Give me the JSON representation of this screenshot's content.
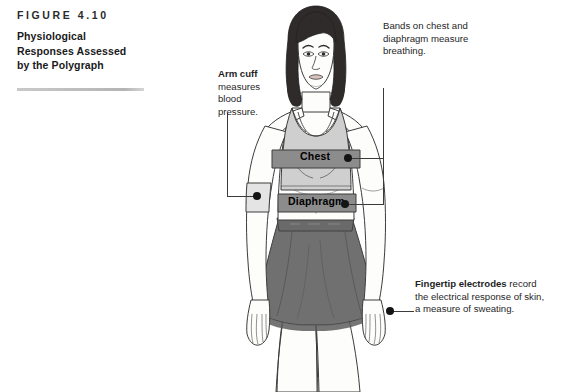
{
  "caption": {
    "figure_number": "Figure 4.10",
    "title_line1": "Physiological",
    "title_line2": "Responses Assessed",
    "title_line3": "by the Polygraph",
    "rule_color": "#b4b4b4"
  },
  "annotations": {
    "arm_cuff": {
      "heading": "Arm cuff",
      "body": " measures blood pressure."
    },
    "bands": {
      "heading": "",
      "body": "Bands on chest and diaphragm measure breathing."
    },
    "fingertip": {
      "heading": "Fingertip electrodes",
      "body": " record the electrical response of skin, a measure of sweating."
    }
  },
  "band_labels": {
    "chest": "Chest",
    "diaphragm": "Diaphragm"
  },
  "colors": {
    "background": "#ffffff",
    "skin": "#fdfdfb",
    "outline": "#3c3c3c",
    "hair": "#2e2b2a",
    "top": "#cfcfcf",
    "band": "#8c8c8c",
    "skirt": "#707070",
    "waistband": "#6a6a6a",
    "cuff": "#e4e4e4",
    "leader": "#3a3a3a",
    "dot": "#141414",
    "text": "#1f1f1f"
  }
}
